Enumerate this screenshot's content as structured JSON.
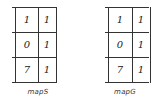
{
  "maps": [
    {
      "name": "mapS",
      "cells": [
        [
          "1",
          "1"
        ],
        [
          "0",
          "1"
        ],
        [
          "7",
          "1"
        ]
      ]
    },
    {
      "name": "mapG",
      "cells": [
        [
          "1",
          "1"
        ],
        [
          "0",
          "1"
        ],
        [
          "7",
          "1"
        ]
      ]
    }
  ]
}
